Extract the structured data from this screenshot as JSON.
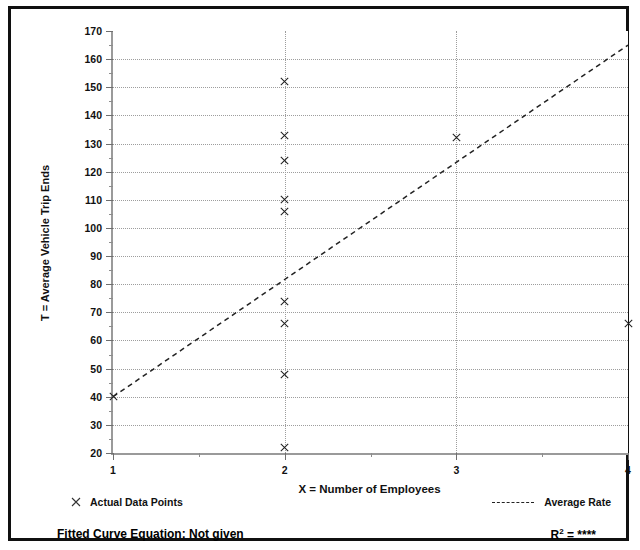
{
  "figure": {
    "title": "",
    "border_color": "#101010",
    "background": "#ffffff"
  },
  "chart_data": {
    "type": "scatter",
    "title": "",
    "xlabel": "X = Number of Employees",
    "ylabel": "T = Average Vehicle Trip Ends",
    "xlim": [
      1,
      4
    ],
    "ylim": [
      20,
      170
    ],
    "xticks": [
      1,
      2,
      3,
      4
    ],
    "yticks": [
      20,
      30,
      40,
      50,
      60,
      70,
      80,
      90,
      100,
      110,
      120,
      130,
      140,
      150,
      160,
      170
    ],
    "y_minor_tick_step": 5,
    "grid": "dotted horizontal at every major y tick; dotted vertical at x = 2 and x = 3",
    "legend_position": "below-plot",
    "series": [
      {
        "name": "Actual Data Points",
        "type": "scatter",
        "marker": "x",
        "color": "#222222",
        "points": [
          {
            "x": 1,
            "y": 40
          },
          {
            "x": 2,
            "y": 152
          },
          {
            "x": 2,
            "y": 133
          },
          {
            "x": 2,
            "y": 124
          },
          {
            "x": 2,
            "y": 110
          },
          {
            "x": 2,
            "y": 106
          },
          {
            "x": 2,
            "y": 74
          },
          {
            "x": 2,
            "y": 66
          },
          {
            "x": 2,
            "y": 48
          },
          {
            "x": 2,
            "y": 22
          },
          {
            "x": 3,
            "y": 132
          },
          {
            "x": 4,
            "y": 66
          }
        ]
      },
      {
        "name": "Average Rate",
        "type": "line",
        "style": "dashed",
        "color": "#222222",
        "points": [
          {
            "x": 1,
            "y": 40
          },
          {
            "x": 4,
            "y": 165
          }
        ]
      }
    ]
  },
  "axis": {
    "y_title": "T = Average Vehicle Trip Ends",
    "x_title": "X = Number of Employees",
    "y_tick_labels": [
      "170",
      "160",
      "150",
      "140",
      "130",
      "120",
      "110",
      "100",
      "90",
      "80",
      "70",
      "60",
      "50",
      "40",
      "30",
      "20"
    ],
    "x_tick_labels": [
      "1",
      "2",
      "3",
      "4"
    ]
  },
  "legend": {
    "points_marker_icon": "x-marker-icon",
    "points_label": "Actual Data Points",
    "rate_line_icon": "dashed-line-icon",
    "rate_label": "Average Rate"
  },
  "footer": {
    "fitted_curve_label": "Fitted Curve Equation:  Not given",
    "r_squared_prefix": "R",
    "r_squared_exponent": "2",
    "r_squared_equals": " = ",
    "r_squared_value": "****"
  }
}
